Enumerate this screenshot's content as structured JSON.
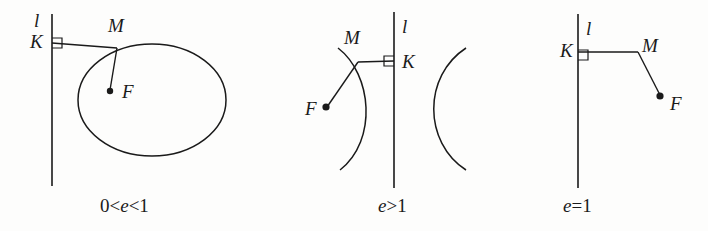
{
  "figure": {
    "background_color": "#fdfdfc",
    "stroke_color": "#1a1a1a"
  },
  "panels": [
    {
      "id": "ellipse",
      "shape": "ellipse",
      "caption_prefix": "0<",
      "caption_var": "e",
      "caption_suffix": "<1",
      "caption_full": "0<e<1",
      "labels": {
        "directrix": "l",
        "foot": "K",
        "point": "M",
        "focus": "F"
      }
    },
    {
      "id": "hyperbola",
      "shape": "hyperbola",
      "caption_prefix": "",
      "caption_var": "e",
      "caption_suffix": ">1",
      "caption_full": "e>1",
      "labels": {
        "directrix": "l",
        "foot": "K",
        "point": "M",
        "focus": "F"
      }
    },
    {
      "id": "parabola",
      "shape": "parabola",
      "caption_prefix": "",
      "caption_var": "e",
      "caption_suffix": "=1",
      "caption_full": "e=1",
      "labels": {
        "directrix": "l",
        "foot": "K",
        "point": "M",
        "focus": "F"
      }
    }
  ]
}
